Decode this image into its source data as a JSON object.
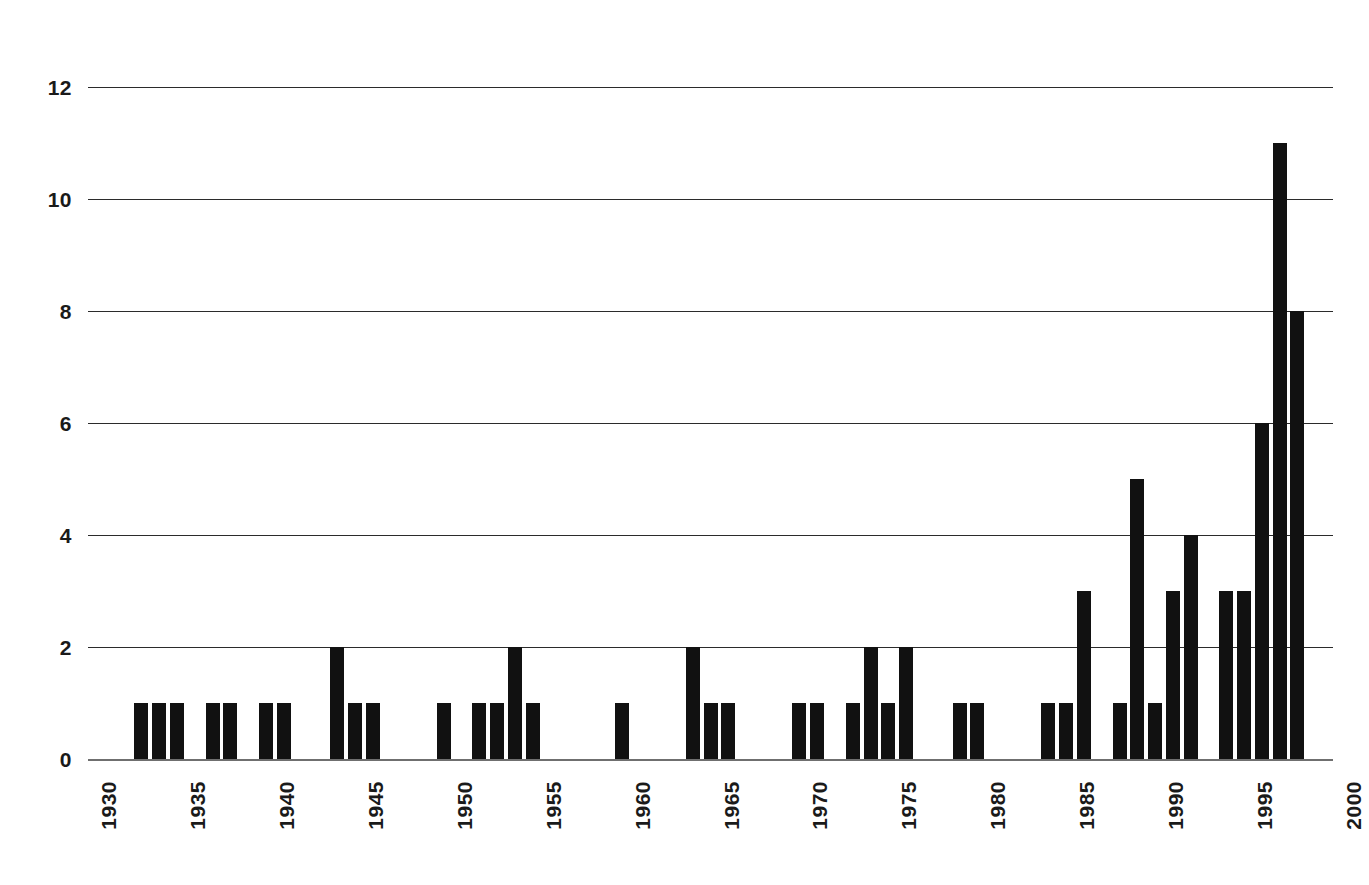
{
  "chart_data": {
    "type": "bar",
    "title": "",
    "subtitle": "",
    "xlabel": "",
    "ylabel": "",
    "xlim": [
      1930,
      2000
    ],
    "ylim": [
      0,
      12
    ],
    "grid": "horizontal",
    "legend": "none",
    "bar_color": "#111111",
    "grid_color": "#2b2b2b",
    "axis_color": "#6f6f6f",
    "y_ticks": [
      0,
      2,
      4,
      6,
      8,
      10,
      12
    ],
    "y_tick_labels": [
      "0",
      "2",
      "4",
      "6",
      "8",
      "10",
      "12"
    ],
    "x_ticks": [
      1930,
      1935,
      1940,
      1945,
      1950,
      1955,
      1960,
      1965,
      1970,
      1975,
      1980,
      1985,
      1990,
      1995,
      2000
    ],
    "x_tick_labels": [
      "1930",
      "1935",
      "1940",
      "1945",
      "1950",
      "1955",
      "1960",
      "1965",
      "1970",
      "1975",
      "1980",
      "1985",
      "1990",
      "1995",
      "2000"
    ],
    "x": [
      1933,
      1934,
      1935,
      1937,
      1938,
      1940,
      1941,
      1944,
      1945,
      1946,
      1950,
      1952,
      1953,
      1954,
      1955,
      1960,
      1964,
      1965,
      1966,
      1970,
      1971,
      1973,
      1974,
      1975,
      1976,
      1979,
      1980,
      1984,
      1985,
      1986,
      1988,
      1989,
      1990,
      1991,
      1992,
      1994,
      1995,
      1996,
      1997,
      1998
    ],
    "values": [
      1,
      1,
      1,
      1,
      1,
      1,
      1,
      2,
      1,
      1,
      1,
      1,
      1,
      2,
      1,
      1,
      2,
      1,
      1,
      1,
      1,
      1,
      2,
      1,
      2,
      1,
      1,
      1,
      1,
      3,
      1,
      5,
      1,
      3,
      4,
      3,
      3,
      6,
      11,
      8
    ],
    "categories": [
      "1933",
      "1934",
      "1935",
      "1937",
      "1938",
      "1940",
      "1941",
      "1944",
      "1945",
      "1946",
      "1950",
      "1952",
      "1953",
      "1954",
      "1955",
      "1960",
      "1964",
      "1965",
      "1966",
      "1970",
      "1971",
      "1973",
      "1974",
      "1975",
      "1976",
      "1979",
      "1980",
      "1984",
      "1985",
      "1986",
      "1988",
      "1989",
      "1990",
      "1991",
      "1992",
      "1994",
      "1995",
      "1996",
      "1997",
      "1998"
    ]
  }
}
